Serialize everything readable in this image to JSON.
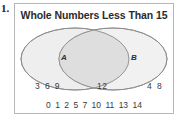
{
  "problem": {
    "number_label": "1."
  },
  "diagram": {
    "title": "Whole Numbers Less Than 15",
    "type": "venn-two-set",
    "sets": [
      {
        "id": "A",
        "label": "A",
        "only_members_text": "3 6 9",
        "only_members": [
          3,
          6,
          9
        ]
      },
      {
        "id": "B",
        "label": "B",
        "only_members_text": "4 8",
        "only_members": [
          4,
          8
        ]
      }
    ],
    "intersection": {
      "members_text": "12",
      "members": [
        12
      ]
    },
    "outside": {
      "members": [
        "0",
        "1",
        "2",
        "5",
        "7",
        "10",
        "11",
        "13",
        "14"
      ]
    },
    "colors": {
      "frame_border": "#b6b6b6",
      "ellipse_fill": "#eeeeee",
      "ellipse_stroke": "#8c8c8c",
      "intersection_fill": "#e0e0e0",
      "title_text": "#2b2b2b",
      "member_text": "#3a3a3a"
    }
  }
}
